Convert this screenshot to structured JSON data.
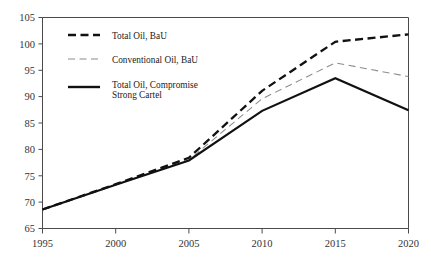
{
  "chart_data": {
    "type": "line",
    "title": "",
    "subtitle": "",
    "xlabel": "",
    "ylabel": "",
    "x": [
      1995,
      2000,
      2005,
      2010,
      2015,
      2020
    ],
    "xlim": [
      1995,
      2020
    ],
    "ylim": [
      65,
      105
    ],
    "xticks": [
      "1995",
      "2000",
      "2005",
      "2010",
      "2015",
      "2020"
    ],
    "yticks": [
      "65",
      "70",
      "75",
      "80",
      "85",
      "90",
      "95",
      "100",
      "105"
    ],
    "grid": false,
    "legend_position": "top-left-inside",
    "series": [
      {
        "name": "Total Oil, BaU",
        "style": "thick-dashed",
        "color": "#111111",
        "values": [
          68.6,
          73.4,
          78.4,
          91.1,
          100.4,
          101.8
        ]
      },
      {
        "name": "Conventional Oil, BaU",
        "style": "thin-dashed",
        "color": "#8c8c8c",
        "values": [
          68.6,
          73.3,
          78.0,
          89.6,
          96.4,
          93.8
        ]
      },
      {
        "name": "Total Oil, Compromise Strong Cartel",
        "style": "solid",
        "color": "#111111",
        "values": [
          68.6,
          73.3,
          77.9,
          87.3,
          93.5,
          87.4
        ]
      }
    ]
  },
  "legend": {
    "entries": [
      {
        "label": "Total Oil, BaU"
      },
      {
        "label": "Conventional Oil, BaU"
      },
      {
        "label": "Total Oil, Compromise",
        "label2": "Strong Cartel"
      }
    ]
  }
}
